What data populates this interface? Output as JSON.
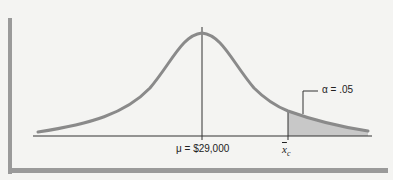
{
  "figure": {
    "type": "normal-distribution-right-tail",
    "mean_label": "μ = $29,000",
    "critical_value_label": "x",
    "critical_value_subscript": "c",
    "alpha_label": "α = .05",
    "colors": {
      "curve": "#8a8a8a",
      "axis": "#333333",
      "shaded_region": "#c8c8c8",
      "frame": "#9a9a9a",
      "background": "#f4f4f2"
    }
  }
}
